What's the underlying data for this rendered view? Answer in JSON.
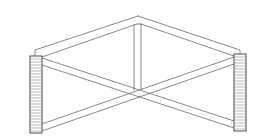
{
  "diagram": {
    "title": "",
    "type": "structural line drawing",
    "colors": {
      "background": "#ffffff",
      "line": "#6b6b6b",
      "post_outline": "#4a4a4a",
      "hatch": "#8a8a8a"
    },
    "components": [
      {
        "id": "left-post",
        "label": ""
      },
      {
        "id": "right-post",
        "label": ""
      },
      {
        "id": "top-beam-left",
        "label": ""
      },
      {
        "id": "top-beam-right",
        "label": ""
      },
      {
        "id": "center-vertical",
        "label": ""
      },
      {
        "id": "diagonal-brace-1",
        "label": ""
      },
      {
        "id": "diagonal-brace-2",
        "label": ""
      }
    ]
  }
}
